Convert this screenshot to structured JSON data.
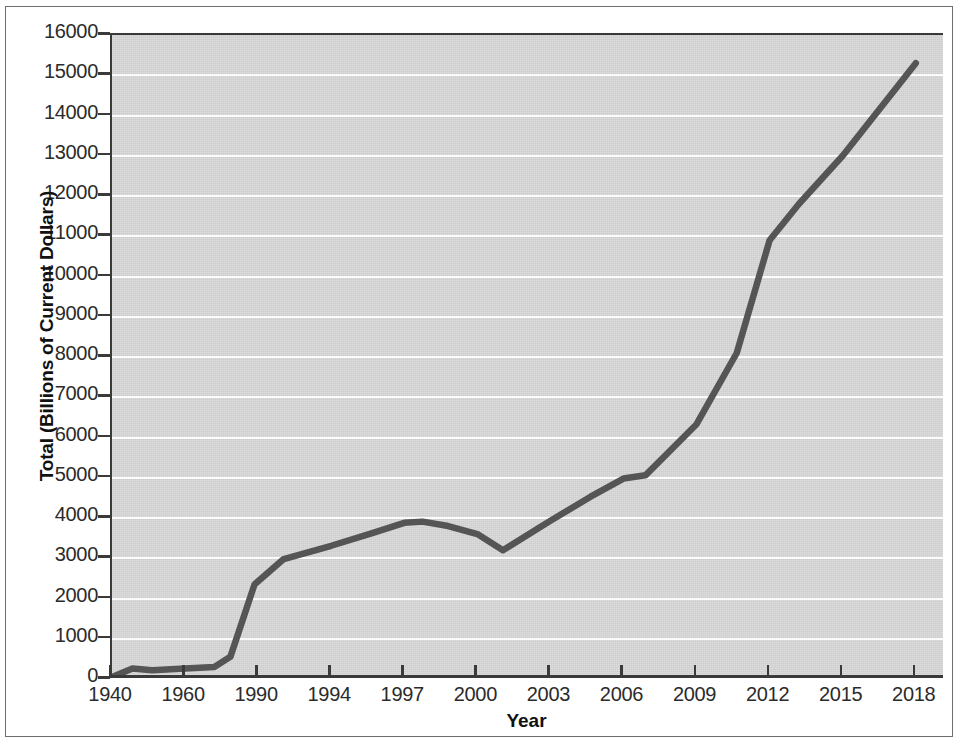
{
  "chart_data": {
    "type": "line",
    "title": "",
    "xlabel": "Year",
    "ylabel": "Total (Billions of Current Dollars)",
    "xlim_labels": [
      "1940",
      "2018"
    ],
    "ylim": [
      0,
      16000
    ],
    "grid": true,
    "legend": "none",
    "line_color": "#555555",
    "plot_background": "#d9d9d9",
    "gridline_color": "#fbfbfb",
    "axis_color": "#3a3a3a",
    "y_ticks": [
      "16000",
      "15000",
      "14000",
      "13000",
      "12000",
      "11000",
      "10000",
      "9000",
      "8000",
      "7000",
      "6000",
      "5000",
      "4000",
      "3000",
      "2000",
      "1000",
      "0"
    ],
    "y_tick_values": [
      16000,
      15000,
      14000,
      13000,
      12000,
      11000,
      10000,
      9000,
      8000,
      7000,
      6000,
      5000,
      4000,
      3000,
      2000,
      1000,
      0
    ],
    "x_ticks": [
      "1940",
      "1960",
      "1990",
      "1994",
      "1997",
      "2000",
      "2003",
      "2006",
      "2009",
      "2012",
      "2015",
      "2018"
    ],
    "x_tick_values": [
      1940,
      1960,
      1990,
      1994,
      1997,
      2000,
      2003,
      2006,
      2009,
      2012,
      2015,
      2018
    ],
    "note": "x axis is categorical/non-uniform: ticks are evenly spaced across the axis",
    "series": [
      {
        "name": "Total",
        "points": [
          {
            "x_index": 0.0,
            "x_label": "1940",
            "value": 50
          },
          {
            "x_index": 0.28,
            "x_label": "",
            "value": 260
          },
          {
            "x_index": 0.55,
            "x_label": "",
            "value": 215
          },
          {
            "x_index": 1.0,
            "x_label": "1960",
            "value": 260
          },
          {
            "x_index": 1.4,
            "x_label": "",
            "value": 300
          },
          {
            "x_index": 1.62,
            "x_label": "",
            "value": 550
          },
          {
            "x_index": 1.95,
            "x_label": "",
            "value": 2350
          },
          {
            "x_index": 2.0,
            "x_label": "1990",
            "value": 2430
          },
          {
            "x_index": 2.35,
            "x_label": "",
            "value": 2980
          },
          {
            "x_index": 3.0,
            "x_label": "1994",
            "value": 3310
          },
          {
            "x_index": 3.55,
            "x_label": "",
            "value": 3620
          },
          {
            "x_index": 4.0,
            "x_label": "1997",
            "value": 3880
          },
          {
            "x_index": 4.25,
            "x_label": "",
            "value": 3910
          },
          {
            "x_index": 4.6,
            "x_label": "",
            "value": 3800
          },
          {
            "x_index": 5.0,
            "x_label": "2000",
            "value": 3600
          },
          {
            "x_index": 5.35,
            "x_label": "",
            "value": 3200
          },
          {
            "x_index": 6.0,
            "x_label": "2003",
            "value": 3930
          },
          {
            "x_index": 6.55,
            "x_label": "",
            "value": 4530
          },
          {
            "x_index": 7.0,
            "x_label": "2006",
            "value": 4980
          },
          {
            "x_index": 7.3,
            "x_label": "",
            "value": 5060
          },
          {
            "x_index": 8.0,
            "x_label": "2009",
            "value": 6330
          },
          {
            "x_index": 8.55,
            "x_label": "",
            "value": 8100
          },
          {
            "x_index": 9.0,
            "x_label": "2012",
            "value": 10900
          },
          {
            "x_index": 9.4,
            "x_label": "",
            "value": 11800
          },
          {
            "x_index": 10.0,
            "x_label": "2015",
            "value": 13000
          },
          {
            "x_index": 11.0,
            "x_label": "2018",
            "value": 15300
          }
        ]
      }
    ]
  }
}
